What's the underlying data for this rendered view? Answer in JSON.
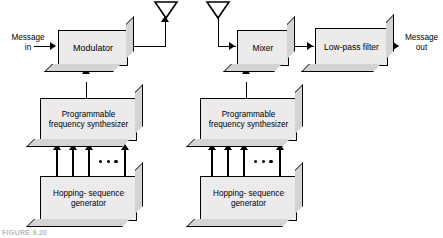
{
  "figure": {
    "caption": "FIGURE 9.20",
    "background_color": "#ffffff",
    "block_fill_color": "#eceaea",
    "block_side_color": "#d5d3d3",
    "line_color": "#000000"
  },
  "transmitter": {
    "input_label": "Message\nin",
    "modulator": {
      "label": "Modulator"
    },
    "synthesizer": {
      "label": "Programmable\nfrequency\nsynthesizer"
    },
    "hopping_generator": {
      "label": "Hopping-\nsequence\ngenerator"
    },
    "bus_ellipsis": "• • •",
    "antenna": "antenna-icon"
  },
  "receiver": {
    "mixer": {
      "label": "Mixer"
    },
    "lowpass_filter": {
      "label": "Low-pass\nfilter"
    },
    "output_label": "Message\nout",
    "synthesizer": {
      "label": "Programmable\nfrequency\nsynthesizer"
    },
    "hopping_generator": {
      "label": "Hopping-\nsequence\ngenerator"
    },
    "bus_ellipsis": "• • •",
    "antenna": "antenna-icon"
  }
}
